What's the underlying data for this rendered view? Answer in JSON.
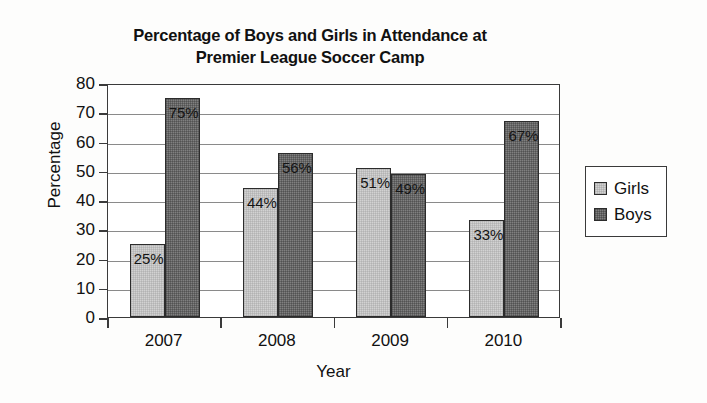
{
  "chart_data": {
    "type": "bar",
    "title": "Percentage of Boys and Girls in Attendance at Premier League Soccer Camp",
    "title_lines": [
      "Percentage of Boys and Girls in Attendance at",
      "Premier League Soccer Camp"
    ],
    "xlabel": "Year",
    "ylabel": "Percentage",
    "categories": [
      "2007",
      "2008",
      "2009",
      "2010"
    ],
    "ylim": [
      0,
      80
    ],
    "ytick_step": 10,
    "yticks": [
      80,
      70,
      60,
      50,
      40,
      30,
      20,
      10,
      0
    ],
    "ytick_labels": [
      "80",
      "70",
      "60",
      "50",
      "40",
      "30",
      "20",
      "10",
      "0"
    ],
    "grid": true,
    "legend_position": "right",
    "series": [
      {
        "name": "Girls",
        "color": "#d2d2d2",
        "values": [
          25,
          44,
          51,
          33
        ],
        "labels": [
          "25%",
          "44%",
          "51%",
          "33%"
        ]
      },
      {
        "name": "Boys",
        "color": "#808080",
        "values": [
          75,
          56,
          49,
          67
        ],
        "labels": [
          "75%",
          "56%",
          "49%",
          "67%"
        ]
      }
    ]
  },
  "legend": {
    "items": [
      {
        "label": "Girls"
      },
      {
        "label": "Boys"
      }
    ]
  },
  "colors": {
    "girls": "#d2d2d2",
    "boys": "#808080",
    "axis": "#3a3a3a",
    "grid": "#8a8a8a",
    "text": "#111111",
    "background": "#ffffff"
  }
}
